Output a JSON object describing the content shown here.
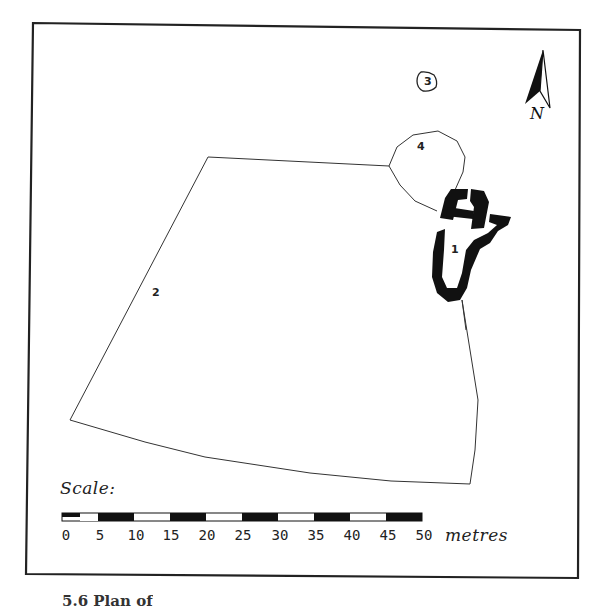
{
  "figure": {
    "caption": "5.6 Plan of",
    "scale": {
      "label": "Scale:",
      "unit": "metres",
      "ticks": [
        "0",
        "5",
        "10",
        "15",
        "20",
        "25",
        "30",
        "35",
        "40",
        "45",
        "50"
      ]
    },
    "north_arrow": {
      "label": "N"
    },
    "sites": [
      {
        "id": "1",
        "label": "1"
      },
      {
        "id": "2",
        "label": "2"
      },
      {
        "id": "3",
        "label": "3"
      },
      {
        "id": "4",
        "label": "4"
      }
    ]
  }
}
